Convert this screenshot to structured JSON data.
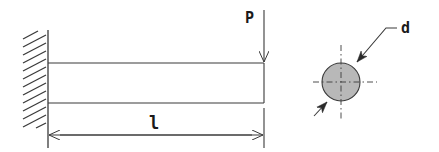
{
  "diagram": {
    "type": "cantilever-beam",
    "labels": {
      "load": "P",
      "length": "l",
      "diameter": "d"
    },
    "colors": {
      "line": "#3a3a3a",
      "section_fill": "#b8b8b8",
      "background": "#ffffff"
    },
    "elements": [
      "fixed-wall-support",
      "beam",
      "point-load-arrow",
      "length-dimension",
      "circular-cross-section",
      "diameter-leader"
    ]
  }
}
